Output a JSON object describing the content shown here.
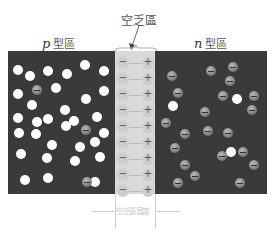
{
  "labels": {
    "depletion_region": "空乏區",
    "p_region_var": "p",
    "p_region_text": "型區",
    "n_region_var": "n",
    "n_region_text": "型區",
    "width_label": "空乏區寬度"
  },
  "colors": {
    "panel": "#3a3a3a",
    "depletion": "#d9d9d9",
    "hole": "#ffffff",
    "ion": "#888888"
  },
  "p_region": {
    "holes": [
      [
        18,
        70
      ],
      [
        30,
        76
      ],
      [
        48,
        71
      ],
      [
        67,
        74
      ],
      [
        85,
        65
      ],
      [
        104,
        71
      ],
      [
        18,
        94
      ],
      [
        32,
        105
      ],
      [
        56,
        88
      ],
      [
        65,
        110
      ],
      [
        86,
        99
      ],
      [
        104,
        91
      ],
      [
        18,
        118
      ],
      [
        37,
        122
      ],
      [
        48,
        119
      ],
      [
        74,
        121
      ],
      [
        97,
        117
      ],
      [
        19,
        133
      ],
      [
        36,
        134
      ],
      [
        52,
        145
      ],
      [
        66,
        126
      ],
      [
        80,
        147
      ],
      [
        95,
        142
      ],
      [
        104,
        133
      ],
      [
        21,
        154
      ],
      [
        47,
        158
      ],
      [
        75,
        161
      ],
      [
        100,
        157
      ],
      [
        25,
        180
      ],
      [
        48,
        178
      ],
      [
        95,
        182
      ]
    ],
    "ions": [
      [
        37,
        90
      ],
      [
        86,
        130
      ],
      [
        87,
        182
      ]
    ]
  },
  "n_region": {
    "electrons": [
      [
        172,
        76
      ],
      [
        211,
        71
      ],
      [
        233,
        67
      ],
      [
        230,
        81
      ],
      [
        178,
        93
      ],
      [
        223,
        96
      ],
      [
        166,
        123
      ],
      [
        205,
        112
      ],
      [
        252,
        110
      ],
      [
        185,
        134
      ],
      [
        208,
        131
      ],
      [
        175,
        148
      ],
      [
        228,
        133
      ],
      [
        243,
        152
      ],
      [
        185,
        165
      ],
      [
        222,
        156
      ],
      [
        254,
        165
      ],
      [
        195,
        176
      ],
      [
        240,
        183
      ],
      [
        178,
        183
      ],
      [
        254,
        96
      ]
    ],
    "holes": [
      [
        237,
        99
      ],
      [
        173,
        106
      ],
      [
        231,
        152
      ]
    ]
  },
  "depletion_rows": [
    {
      "neg": "−",
      "pos": "+"
    },
    {
      "neg": "−",
      "pos": "+"
    },
    {
      "neg": "−",
      "pos": "+"
    },
    {
      "neg": "−",
      "pos": "+"
    },
    {
      "neg": "−",
      "pos": "+"
    },
    {
      "neg": "−",
      "pos": "+"
    },
    {
      "neg": "−",
      "pos": "+"
    },
    {
      "neg": "−",
      "pos": "+"
    },
    {
      "neg": "−",
      "pos": "+"
    }
  ]
}
